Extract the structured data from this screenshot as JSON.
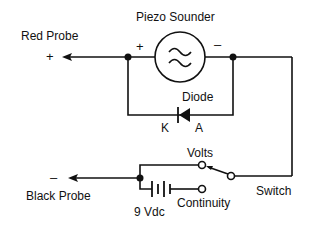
{
  "diagram": {
    "title": "Piezo Sounder",
    "labels": {
      "red_probe": "Red Probe",
      "red_probe_polarity": "+",
      "black_probe": "Black Probe",
      "black_probe_polarity": "–",
      "sounder": "Piezo Sounder",
      "sounder_plus": "+",
      "sounder_minus": "–",
      "diode": "Diode",
      "cathode": "K",
      "anode": "A",
      "volts": "Volts",
      "continuity": "Continuity",
      "battery": "9 Vdc",
      "switch": "Switch"
    },
    "components": [
      {
        "id": "piezo",
        "type": "piezo-sounder",
        "label": "Piezo Sounder"
      },
      {
        "id": "diode",
        "type": "diode",
        "label": "Diode",
        "pins": [
          "K",
          "A"
        ]
      },
      {
        "id": "battery",
        "type": "battery",
        "label": "9 Vdc"
      },
      {
        "id": "switch",
        "type": "spdt-switch",
        "label": "Switch",
        "positions": [
          "Volts",
          "Continuity"
        ]
      },
      {
        "id": "red-probe",
        "type": "probe",
        "label": "Red Probe",
        "polarity": "+"
      },
      {
        "id": "black-probe",
        "type": "probe",
        "label": "Black Probe",
        "polarity": "–"
      }
    ],
    "colors": {
      "line": "#111111",
      "background": "#ffffff"
    }
  }
}
